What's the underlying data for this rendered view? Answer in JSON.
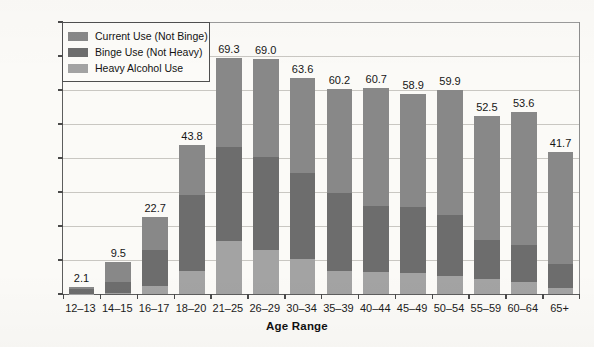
{
  "chart_data": {
    "type": "bar",
    "subtype": "stacked-bar",
    "title": "",
    "xlabel": "Age Range",
    "ylabel": "Percent Using in Past Month",
    "ylim": [
      0,
      80
    ],
    "ytick_step": 10,
    "yticks": [
      0,
      10,
      20,
      30,
      40,
      50,
      60,
      70,
      80
    ],
    "grid": "horizontal",
    "legend_position": "top-left-inside",
    "categories": [
      "12–13",
      "14–15",
      "16–17",
      "18–20",
      "21–25",
      "26–29",
      "30–34",
      "35–39",
      "40–44",
      "45–49",
      "50–54",
      "55–59",
      "60–64",
      "65+"
    ],
    "totals": [
      2.1,
      9.5,
      22.7,
      43.8,
      69.3,
      69.0,
      63.6,
      60.2,
      60.7,
      58.9,
      59.9,
      52.5,
      53.6,
      41.7
    ],
    "total_labels": [
      "2.1",
      "9.5",
      "22.7",
      "43.8",
      "69.3",
      "69.0",
      "63.6",
      "60.2",
      "60.7",
      "58.9",
      "59.9",
      "52.5",
      "53.6",
      "41.7"
    ],
    "series": [
      {
        "name": "Heavy Alcohol Use",
        "color": "#a3a3a3",
        "values": [
          0.1,
          0.3,
          2.5,
          6.9,
          15.6,
          12.9,
          10.2,
          6.8,
          6.5,
          6.3,
          5.4,
          4.3,
          3.5,
          1.8
        ]
      },
      {
        "name": "Binge Use (Not Heavy)",
        "color": "#6d6d6d",
        "values": [
          1.5,
          3.3,
          10.5,
          22.1,
          27.7,
          27.3,
          25.3,
          22.9,
          19.3,
          19.4,
          17.9,
          11.7,
          10.9,
          6.9
        ]
      },
      {
        "name": "Current Use (Not Binge)",
        "color": "#888888",
        "values": [
          0.5,
          5.9,
          9.7,
          14.8,
          26.0,
          28.8,
          28.1,
          30.5,
          34.9,
          33.2,
          36.6,
          36.5,
          39.2,
          33.0
        ]
      }
    ]
  },
  "legend": {
    "items": [
      {
        "label": "Current Use (Not Binge)",
        "color": "#888888"
      },
      {
        "label": "Binge Use (Not Heavy)",
        "color": "#6d6d6d"
      },
      {
        "label": "Heavy Alcohol Use",
        "color": "#a3a3a3"
      }
    ]
  },
  "axes": {
    "y_title": "Percent Using in Past Month",
    "x_title": "Age Range"
  }
}
